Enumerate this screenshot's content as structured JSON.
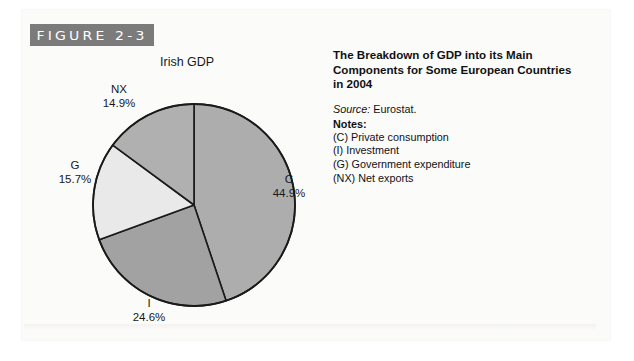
{
  "figure": {
    "banner_label": "FIGURE 2-3"
  },
  "caption": {
    "title": "The Breakdown of GDP into its Main Components for Some European Countries in 2004",
    "source_word": "Source:",
    "source_value": " Eurostat.",
    "notes_heading": "Notes:",
    "notes": [
      "(C) Private consumption",
      "(I) Investment",
      "(G) Government expenditure",
      "(NX) Net exports"
    ]
  },
  "chart_data": {
    "type": "pie",
    "title": "Irish GDP",
    "xlabel": "",
    "ylabel": "",
    "legend_position": "outside-labels",
    "grid": false,
    "start_angle_deg": 0,
    "direction": "clockwise",
    "categories": [
      "C",
      "I",
      "G",
      "NX"
    ],
    "values": [
      44.9,
      24.6,
      15.7,
      14.9
    ],
    "labels": [
      {
        "name": "C",
        "pct": "44.9%",
        "value": 44.9,
        "color": "#adadad"
      },
      {
        "name": "I",
        "pct": "24.6%",
        "value": 24.6,
        "color": "#a2a2a2"
      },
      {
        "name": "G",
        "pct": "15.7%",
        "value": 15.7,
        "color": "#e9e9e9"
      },
      {
        "name": "NX",
        "pct": "14.9%",
        "value": 14.9,
        "color": "#b0b0b0"
      }
    ],
    "stroke_color": "#1a1a1a",
    "units": "percent of GDP"
  },
  "colors": {
    "banner_bg": "#7b7b7b",
    "banner_text": "#ffffff",
    "page_bg": "#fbfbfa",
    "text": "#18181a"
  }
}
